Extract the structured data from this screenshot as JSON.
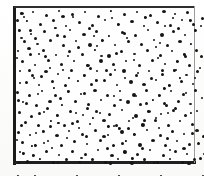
{
  "figure": {
    "type": "scanned-point-pattern",
    "caption": "",
    "background_color": "#fdfdfc",
    "frame": {
      "stroke_color": "#1b1b1b",
      "right_stroke_color": "#9b9b9b",
      "x": 13,
      "y": 6,
      "width": 183,
      "height": 157
    }
  },
  "chart_data": {
    "type": "scatter",
    "title": "",
    "subtitle": "",
    "xlabel": "",
    "ylabel": "",
    "xlim": [
      0,
      183
    ],
    "ylim": [
      0,
      157
    ],
    "grid": false,
    "legend": null,
    "tick_labels": {
      "x": [],
      "y": []
    },
    "annotations": [],
    "marker": {
      "shape": "filled-circle",
      "color": "#141414",
      "size_px_range": [
        2,
        4
      ]
    },
    "point_count": 352,
    "points": [
      [
        6,
        5,
        3
      ],
      [
        18,
        4,
        2
      ],
      [
        31,
        7,
        3
      ],
      [
        44,
        3,
        2
      ],
      [
        57,
        6,
        3
      ],
      [
        70,
        4,
        2
      ],
      [
        83,
        8,
        3
      ],
      [
        96,
        3,
        2
      ],
      [
        109,
        6,
        3
      ],
      [
        122,
        4,
        2
      ],
      [
        135,
        7,
        3
      ],
      [
        148,
        3,
        3
      ],
      [
        160,
        6,
        2
      ],
      [
        172,
        4,
        3
      ],
      [
        12,
        13,
        2
      ],
      [
        25,
        16,
        3
      ],
      [
        38,
        12,
        3
      ],
      [
        51,
        18,
        2
      ],
      [
        64,
        14,
        3
      ],
      [
        77,
        17,
        3
      ],
      [
        90,
        12,
        2
      ],
      [
        103,
        16,
        3
      ],
      [
        116,
        13,
        3
      ],
      [
        129,
        18,
        2
      ],
      [
        142,
        14,
        3
      ],
      [
        155,
        17,
        3
      ],
      [
        167,
        12,
        2
      ],
      [
        178,
        16,
        3
      ],
      [
        4,
        22,
        3
      ],
      [
        16,
        26,
        2
      ],
      [
        29,
        23,
        3
      ],
      [
        42,
        27,
        3
      ],
      [
        55,
        22,
        2
      ],
      [
        68,
        26,
        3
      ],
      [
        81,
        23,
        3
      ],
      [
        94,
        28,
        2
      ],
      [
        107,
        24,
        3
      ],
      [
        120,
        27,
        3
      ],
      [
        133,
        22,
        2
      ],
      [
        146,
        26,
        4
      ],
      [
        158,
        23,
        3
      ],
      [
        170,
        27,
        2
      ],
      [
        180,
        22,
        3
      ],
      [
        9,
        33,
        3
      ],
      [
        22,
        36,
        2
      ],
      [
        35,
        32,
        3
      ],
      [
        48,
        37,
        3
      ],
      [
        61,
        33,
        2
      ],
      [
        74,
        36,
        4
      ],
      [
        87,
        32,
        3
      ],
      [
        100,
        37,
        2
      ],
      [
        113,
        33,
        3
      ],
      [
        126,
        36,
        3
      ],
      [
        139,
        32,
        2
      ],
      [
        152,
        37,
        3
      ],
      [
        164,
        33,
        3
      ],
      [
        176,
        36,
        2
      ],
      [
        3,
        43,
        2
      ],
      [
        15,
        46,
        3
      ],
      [
        28,
        42,
        3
      ],
      [
        41,
        47,
        2
      ],
      [
        54,
        43,
        3
      ],
      [
        67,
        46,
        3
      ],
      [
        80,
        42,
        2
      ],
      [
        93,
        47,
        4
      ],
      [
        106,
        43,
        3
      ],
      [
        119,
        46,
        2
      ],
      [
        132,
        42,
        3
      ],
      [
        145,
        47,
        3
      ],
      [
        157,
        43,
        2
      ],
      [
        169,
        46,
        3
      ],
      [
        181,
        42,
        3
      ],
      [
        7,
        53,
        3
      ],
      [
        20,
        57,
        2
      ],
      [
        33,
        52,
        3
      ],
      [
        46,
        56,
        3
      ],
      [
        59,
        53,
        2
      ],
      [
        72,
        57,
        3
      ],
      [
        85,
        52,
        4
      ],
      [
        98,
        56,
        3
      ],
      [
        111,
        53,
        2
      ],
      [
        124,
        57,
        3
      ],
      [
        137,
        52,
        3
      ],
      [
        150,
        56,
        2
      ],
      [
        162,
        53,
        3
      ],
      [
        174,
        57,
        3
      ],
      [
        5,
        63,
        2
      ],
      [
        17,
        67,
        3
      ],
      [
        30,
        63,
        3
      ],
      [
        43,
        66,
        2
      ],
      [
        56,
        62,
        3
      ],
      [
        69,
        67,
        3
      ],
      [
        82,
        63,
        2
      ],
      [
        95,
        66,
        3
      ],
      [
        108,
        62,
        4
      ],
      [
        121,
        67,
        3
      ],
      [
        134,
        63,
        2
      ],
      [
        147,
        66,
        3
      ],
      [
        159,
        62,
        3
      ],
      [
        171,
        67,
        2
      ],
      [
        182,
        63,
        3
      ],
      [
        11,
        74,
        3
      ],
      [
        24,
        77,
        2
      ],
      [
        37,
        73,
        3
      ],
      [
        50,
        77,
        3
      ],
      [
        63,
        73,
        2
      ],
      [
        76,
        76,
        3
      ],
      [
        89,
        72,
        3
      ],
      [
        102,
        77,
        2
      ],
      [
        115,
        73,
        4
      ],
      [
        128,
        76,
        3
      ],
      [
        141,
        72,
        2
      ],
      [
        154,
        77,
        3
      ],
      [
        166,
        73,
        3
      ],
      [
        178,
        76,
        2
      ],
      [
        2,
        84,
        3
      ],
      [
        14,
        87,
        3
      ],
      [
        27,
        83,
        2
      ],
      [
        40,
        87,
        3
      ],
      [
        53,
        83,
        3
      ],
      [
        66,
        86,
        2
      ],
      [
        79,
        82,
        3
      ],
      [
        92,
        87,
        3
      ],
      [
        105,
        83,
        2
      ],
      [
        118,
        86,
        4
      ],
      [
        131,
        82,
        3
      ],
      [
        144,
        87,
        3
      ],
      [
        156,
        83,
        2
      ],
      [
        168,
        86,
        3
      ],
      [
        180,
        82,
        3
      ],
      [
        8,
        94,
        2
      ],
      [
        21,
        97,
        3
      ],
      [
        34,
        93,
        3
      ],
      [
        47,
        97,
        2
      ],
      [
        60,
        93,
        3
      ],
      [
        73,
        96,
        3
      ],
      [
        86,
        92,
        2
      ],
      [
        99,
        97,
        3
      ],
      [
        112,
        93,
        4
      ],
      [
        125,
        96,
        3
      ],
      [
        138,
        92,
        2
      ],
      [
        151,
        97,
        3
      ],
      [
        163,
        93,
        3
      ],
      [
        175,
        96,
        2
      ],
      [
        4,
        104,
        3
      ],
      [
        16,
        108,
        3
      ],
      [
        29,
        104,
        2
      ],
      [
        42,
        107,
        3
      ],
      [
        55,
        103,
        3
      ],
      [
        68,
        107,
        2
      ],
      [
        81,
        103,
        3
      ],
      [
        94,
        106,
        3
      ],
      [
        107,
        102,
        2
      ],
      [
        120,
        107,
        4
      ],
      [
        133,
        103,
        3
      ],
      [
        146,
        106,
        2
      ],
      [
        158,
        102,
        3
      ],
      [
        170,
        107,
        3
      ],
      [
        182,
        103,
        2
      ],
      [
        10,
        114,
        3
      ],
      [
        23,
        117,
        3
      ],
      [
        36,
        113,
        2
      ],
      [
        49,
        117,
        3
      ],
      [
        62,
        113,
        3
      ],
      [
        75,
        116,
        2
      ],
      [
        88,
        112,
        3
      ],
      [
        101,
        117,
        3
      ],
      [
        114,
        113,
        2
      ],
      [
        127,
        116,
        4
      ],
      [
        140,
        112,
        3
      ],
      [
        153,
        117,
        3
      ],
      [
        165,
        113,
        2
      ],
      [
        177,
        116,
        3
      ],
      [
        3,
        124,
        3
      ],
      [
        15,
        127,
        2
      ],
      [
        28,
        123,
        3
      ],
      [
        41,
        127,
        3
      ],
      [
        54,
        123,
        2
      ],
      [
        67,
        126,
        3
      ],
      [
        80,
        122,
        3
      ],
      [
        93,
        127,
        2
      ],
      [
        106,
        123,
        4
      ],
      [
        119,
        126,
        3
      ],
      [
        132,
        122,
        2
      ],
      [
        145,
        127,
        3
      ],
      [
        157,
        123,
        3
      ],
      [
        169,
        126,
        2
      ],
      [
        181,
        122,
        3
      ],
      [
        7,
        134,
        3
      ],
      [
        20,
        137,
        3
      ],
      [
        33,
        133,
        2
      ],
      [
        46,
        137,
        3
      ],
      [
        59,
        133,
        3
      ],
      [
        72,
        136,
        2
      ],
      [
        85,
        132,
        3
      ],
      [
        98,
        137,
        3
      ],
      [
        111,
        133,
        2
      ],
      [
        124,
        136,
        4
      ],
      [
        137,
        132,
        3
      ],
      [
        150,
        137,
        3
      ],
      [
        162,
        133,
        2
      ],
      [
        174,
        136,
        3
      ],
      [
        5,
        144,
        2
      ],
      [
        18,
        147,
        3
      ],
      [
        31,
        143,
        3
      ],
      [
        44,
        147,
        2
      ],
      [
        57,
        143,
        3
      ],
      [
        70,
        146,
        3
      ],
      [
        83,
        142,
        2
      ],
      [
        96,
        147,
        3
      ],
      [
        109,
        143,
        4
      ],
      [
        122,
        146,
        3
      ],
      [
        135,
        142,
        2
      ],
      [
        148,
        147,
        3
      ],
      [
        160,
        143,
        3
      ],
      [
        172,
        146,
        2
      ],
      [
        12,
        153,
        3
      ],
      [
        25,
        151,
        2
      ],
      [
        38,
        154,
        3
      ],
      [
        51,
        151,
        3
      ],
      [
        64,
        154,
        2
      ],
      [
        77,
        151,
        3
      ],
      [
        90,
        154,
        3
      ],
      [
        103,
        151,
        2
      ],
      [
        116,
        154,
        4
      ],
      [
        129,
        151,
        3
      ],
      [
        142,
        154,
        3
      ],
      [
        155,
        151,
        2
      ],
      [
        167,
        154,
        3
      ],
      [
        179,
        151,
        3
      ],
      [
        9,
        9,
        2
      ],
      [
        40,
        20,
        2
      ],
      [
        63,
        39,
        3
      ],
      [
        97,
        10,
        2
      ],
      [
        141,
        39,
        2
      ],
      [
        163,
        20,
        3
      ],
      [
        48,
        62,
        2
      ],
      [
        110,
        70,
        2
      ],
      [
        149,
        80,
        3
      ],
      [
        23,
        86,
        2
      ],
      [
        72,
        100,
        3
      ],
      [
        118,
        110,
        2
      ],
      [
        88,
        128,
        3
      ],
      [
        37,
        140,
        2
      ],
      [
        152,
        130,
        3
      ],
      [
        176,
        105,
        2
      ],
      [
        186,
        48,
        3
      ],
      [
        187,
        90,
        2
      ],
      [
        188,
        128,
        3
      ],
      [
        186,
        18,
        2
      ],
      [
        185,
        150,
        3
      ],
      [
        190,
        68,
        2
      ],
      [
        191,
        112,
        3
      ],
      [
        6,
        30,
        2
      ],
      [
        5,
        75,
        2
      ],
      [
        6,
        117,
        3
      ],
      [
        4,
        155,
        2
      ],
      [
        20,
        30,
        3
      ],
      [
        58,
        9,
        2
      ],
      [
        130,
        9,
        3
      ],
      [
        158,
        10,
        2
      ],
      [
        74,
        20,
        3
      ],
      [
        112,
        30,
        2
      ],
      [
        30,
        48,
        3
      ],
      [
        86,
        48,
        2
      ],
      [
        170,
        48,
        3
      ],
      [
        54,
        70,
        2
      ],
      [
        14,
        62,
        3
      ],
      [
        100,
        62,
        2
      ],
      [
        136,
        70,
        3
      ],
      [
        180,
        70,
        2
      ],
      [
        24,
        105,
        3
      ],
      [
        64,
        120,
        2
      ],
      [
        104,
        120,
        3
      ],
      [
        144,
        120,
        2
      ],
      [
        168,
        140,
        3
      ],
      [
        52,
        130,
        2
      ],
      [
        92,
        140,
        3
      ],
      [
        19,
        70,
        2
      ],
      [
        45,
        90,
        3
      ],
      [
        78,
        110,
        2
      ],
      [
        107,
        135,
        3
      ],
      [
        123,
        65,
        2
      ],
      [
        160,
        100,
        3
      ],
      [
        143,
        50,
        2
      ],
      [
        32,
        100,
        3
      ],
      [
        66,
        150,
        2
      ],
      [
        117,
        150,
        3
      ],
      [
        150,
        18,
        2
      ],
      [
        101,
        45,
        3
      ],
      [
        35,
        60,
        2
      ],
      [
        69,
        85,
        3
      ],
      [
        99,
        88,
        2
      ],
      [
        131,
        95,
        3
      ],
      [
        165,
        70,
        2
      ],
      [
        49,
        28,
        3
      ],
      [
        82,
        38,
        2
      ],
      [
        13,
        40,
        3
      ],
      [
        190,
        33,
        2
      ],
      [
        192,
        83,
        3
      ],
      [
        189,
        146,
        2
      ],
      [
        175,
        12,
        3
      ],
      [
        141,
        110,
        2
      ],
      [
        113,
        120,
        3
      ],
      [
        85,
        105,
        2
      ],
      [
        57,
        115,
        3
      ],
      [
        29,
        135,
        2
      ],
      [
        15,
        22,
        3
      ],
      [
        43,
        115,
        2
      ],
      [
        71,
        128,
        3
      ],
      [
        99,
        118,
        2
      ],
      [
        127,
        140,
        3
      ],
      [
        155,
        142,
        2
      ],
      [
        183,
        135,
        3
      ],
      [
        185,
        60,
        2
      ],
      [
        8,
        145,
        3
      ],
      [
        21,
        125,
        2
      ],
      [
        95,
        155,
        3
      ],
      [
        139,
        155,
        2
      ],
      [
        173,
        155,
        3
      ],
      [
        43,
        155,
        2
      ],
      [
        11,
        95,
        3
      ],
      [
        39,
        80,
        2
      ],
      [
        91,
        62,
        3
      ],
      [
        119,
        52,
        2
      ],
      [
        147,
        62,
        3
      ],
      [
        171,
        85,
        2
      ],
      [
        26,
        68,
        3
      ],
      [
        53,
        48,
        2
      ],
      [
        81,
        72,
        3
      ],
      [
        105,
        92,
        2
      ],
      [
        129,
        112,
        3
      ],
      [
        153,
        105,
        2
      ],
      [
        177,
        125,
        3
      ],
      [
        61,
        105,
        2
      ],
      [
        35,
        118,
        3
      ],
      [
        17,
        138,
        2
      ],
      [
        75,
        60,
        3
      ],
      [
        145,
        35,
        2
      ],
      [
        109,
        25,
        3
      ],
      [
        79,
        28,
        2
      ],
      [
        47,
        8,
        3
      ],
      [
        24,
        46,
        2
      ],
      [
        93,
        118,
        3
      ],
      [
        121,
        88,
        2
      ],
      [
        149,
        95,
        3
      ],
      [
        161,
        62,
        2
      ],
      [
        187,
        10,
        3
      ],
      [
        193,
        25,
        2
      ],
      [
        192,
        55,
        3
      ],
      [
        191,
        98,
        2
      ],
      [
        193,
        122,
        3
      ],
      [
        192,
        158,
        2
      ],
      [
        2,
        12,
        3
      ],
      [
        2,
        50,
        2
      ],
      [
        3,
        92,
        3
      ],
      [
        2,
        132,
        2
      ],
      [
        3,
        168,
        2
      ],
      [
        20,
        168,
        2
      ],
      [
        62,
        168,
        2
      ],
      [
        104,
        168,
        2
      ],
      [
        146,
        168,
        2
      ],
      [
        188,
        168,
        2
      ]
    ]
  }
}
